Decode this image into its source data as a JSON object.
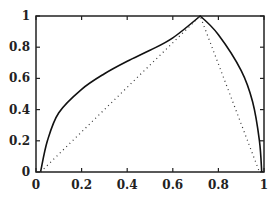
{
  "chart_data": {
    "type": "line",
    "title": "",
    "xlabel": "",
    "ylabel": "",
    "xlim": [
      0,
      1
    ],
    "ylim": [
      0,
      1
    ],
    "grid": false,
    "legend": null,
    "x_ticks": [
      "0",
      "0.2",
      "0.4",
      "0.6",
      "0.8",
      "1"
    ],
    "y_ticks": [
      "0",
      "0.2",
      "0.4",
      "0.6",
      "0.8",
      "1"
    ],
    "series": [
      {
        "name": "solid curve",
        "style": "solid",
        "points": [
          [
            0.02,
            0.0
          ],
          [
            0.05,
            0.2
          ],
          [
            0.1,
            0.38
          ],
          [
            0.2,
            0.53
          ],
          [
            0.3,
            0.63
          ],
          [
            0.4,
            0.71
          ],
          [
            0.5,
            0.78
          ],
          [
            0.6,
            0.86
          ],
          [
            0.72,
            1.0
          ],
          [
            0.8,
            0.88
          ],
          [
            0.9,
            0.65
          ],
          [
            0.95,
            0.45
          ],
          [
            0.98,
            0.2
          ],
          [
            0.99,
            0.0
          ]
        ]
      },
      {
        "name": "dotted line",
        "style": "dotted",
        "points": [
          [
            0.02,
            0.0
          ],
          [
            0.72,
            1.0
          ],
          [
            0.98,
            0.0
          ]
        ]
      }
    ]
  }
}
